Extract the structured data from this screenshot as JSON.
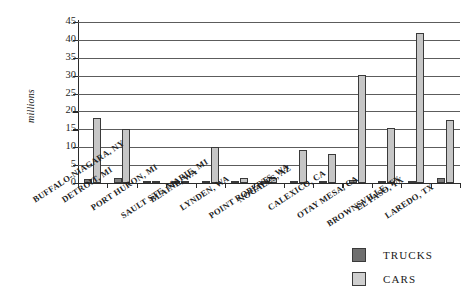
{
  "chart_data": {
    "type": "bar",
    "title": "",
    "xlabel": "",
    "ylabel": "millions",
    "ylim": [
      0,
      45
    ],
    "yticks": [
      0,
      5,
      10,
      15,
      20,
      25,
      30,
      35,
      40,
      45
    ],
    "ytick_labels": [
      "0",
      "5",
      "10",
      "15",
      "20",
      "25",
      "30",
      "35",
      "40",
      "45"
    ],
    "grid": true,
    "legend_position": "bottom-right",
    "categories": [
      "BUFFALO-NIAGARA, NY",
      "DETROIT, MI",
      "PORT HURON, MI",
      "SAULT STE. MARIE, MI",
      "BLAINE, WA",
      "LYNDEN, WA",
      "POINT ROBERTS, WA",
      "NOGALES, AZ",
      "CALEXICO, CA",
      "OTAY MESA, CA",
      "BROWNSVILLE, TX",
      "EL PASO, TX",
      "LAREDO, TX"
    ],
    "series": [
      {
        "name": "TRUCKS",
        "color": "#7d7d7d",
        "values": [
          1.1,
          1.4,
          0.7,
          0.15,
          0.35,
          0.1,
          0.05,
          0.3,
          0.3,
          0.9,
          0.5,
          0.7,
          1.4
        ]
      },
      {
        "name": "CARS",
        "color": "#c6c6c6",
        "values": [
          18.2,
          15.2,
          0.5,
          0.3,
          10.0,
          1.4,
          1.5,
          9.3,
          8.2,
          30.2,
          15.4,
          42.0,
          17.5
        ]
      }
    ]
  },
  "legend": {
    "items": [
      {
        "label": "TRUCKS",
        "swatch": "trucks"
      },
      {
        "label": "CARS",
        "swatch": "cars"
      }
    ]
  }
}
